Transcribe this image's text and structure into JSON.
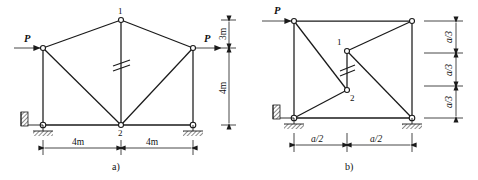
{
  "figures": [
    {
      "caption": "a)",
      "loads": [
        {
          "label": "P",
          "direction": "right",
          "at": "left-upper-joint"
        },
        {
          "label": "P",
          "direction": "right",
          "at": "right-upper-joint"
        }
      ],
      "nodes": [
        {
          "label": "1",
          "position": "apex"
        },
        {
          "label": "2",
          "position": "bottom-center"
        }
      ],
      "horizontal_dimensions": [
        "4m",
        "4m"
      ],
      "vertical_dimensions": [
        "3m",
        "4m"
      ],
      "supports": [
        "pin-left",
        "pin-right"
      ],
      "internal_hinge": true
    },
    {
      "caption": "b)",
      "loads": [
        {
          "label": "P",
          "direction": "right",
          "at": "top-left-joint"
        }
      ],
      "nodes": [
        {
          "label": "1",
          "position": "upper-middle"
        },
        {
          "label": "2",
          "position": "lower-middle"
        }
      ],
      "horizontal_dimensions": [
        "a/2",
        "a/2"
      ],
      "vertical_dimensions": [
        "a/3",
        "a/3",
        "a/3"
      ],
      "supports": [
        "pin-left",
        "pin-right"
      ],
      "internal_hinge": true
    }
  ],
  "colors": {
    "line": "#1a1a1a",
    "background": "#ffffff",
    "node_fill": "#ffffff"
  }
}
